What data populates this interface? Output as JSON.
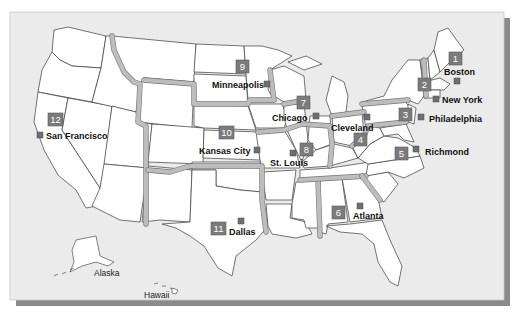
{
  "map": {
    "title": "Federal Reserve Districts",
    "districts": [
      {
        "number": "1",
        "city": "Boston"
      },
      {
        "number": "2",
        "city": "New York"
      },
      {
        "number": "3",
        "city": "Philadelphia"
      },
      {
        "number": "4",
        "city": "Cleveland"
      },
      {
        "number": "5",
        "city": "Richmond"
      },
      {
        "number": "6",
        "city": "Atlanta"
      },
      {
        "number": "7",
        "city": "Chicago"
      },
      {
        "number": "8",
        "city": "St. Louis"
      },
      {
        "number": "9",
        "city": "Minneapolis"
      },
      {
        "number": "10",
        "city": "Kansas City"
      },
      {
        "number": "11",
        "city": "Dallas"
      },
      {
        "number": "12",
        "city": "San Francisco"
      }
    ],
    "insets": [
      {
        "name": "Alaska"
      },
      {
        "name": "Hawaii"
      }
    ],
    "colors": {
      "background": "#ebebeb",
      "state_fill": "#ffffff",
      "district_border": "#bdbdbd",
      "badge": "#7b7b7b",
      "marker": "#6f6f6f",
      "shadow": "#8a8a8a"
    }
  }
}
